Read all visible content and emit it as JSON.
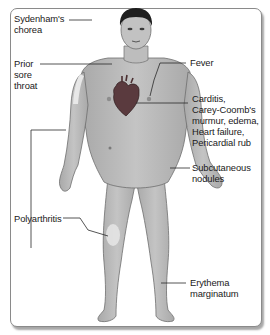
{
  "diagram": {
    "labels": {
      "sydenhams_chorea": "Sydenham's\nchorea",
      "prior_sore_throat": "Prior\nsore\nthroat",
      "fever": "Fever",
      "carditis": "Carditis,\nCarey-Coomb's\nmurmur, edema,\nHeart failure,\nPericardial rub",
      "subcutaneous_nodules": "Subcutaneous\nnodules",
      "polyarthritis": "Polyarthritis",
      "erythema_marginatum": "Erythema\nmarginatum"
    },
    "colors": {
      "skin": "#b9b9b9",
      "skin_outline": "#6e6e6e",
      "hair": "#1e1e1e",
      "heart": "#5a3a3e",
      "highlight": "#e8e8e8",
      "leader_line": "#2a2a2a",
      "frame_border": "#8a8a8a"
    }
  }
}
